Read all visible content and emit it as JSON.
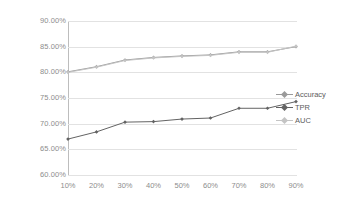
{
  "chart_data": {
    "type": "line",
    "title": "",
    "subtitle": "",
    "xlabel": "",
    "ylabel": "",
    "categories": [
      "10%",
      "20%",
      "30%",
      "40%",
      "50%",
      "60%",
      "70%",
      "80%",
      "90%"
    ],
    "x": [
      10,
      20,
      30,
      40,
      50,
      60,
      70,
      80,
      90
    ],
    "ylim": [
      60,
      90
    ],
    "xlim": [
      10,
      90
    ],
    "y_tick_labels": [
      "90.00%",
      "85.00%",
      "80.00%",
      "75.00%",
      "70.00%",
      "65.00%",
      "60.00%"
    ],
    "y_tick_values": [
      90,
      85,
      80,
      75,
      70,
      65,
      60
    ],
    "x_tick_labels": [
      "10%",
      "20%",
      "30%",
      "40%",
      "50%",
      "60%",
      "70%",
      "80%",
      "90%"
    ],
    "grid": "horizontal",
    "legend_position": "right",
    "value_suffix": "%",
    "series": [
      {
        "name": "Accuracy",
        "color": "#9a9a9a",
        "values": [
          80.1,
          81.1,
          82.4,
          82.9,
          83.2,
          83.4,
          84.0,
          84.0,
          85.0
        ]
      },
      {
        "name": "TPR",
        "color": "#636363",
        "values": [
          67.0,
          68.4,
          70.3,
          70.4,
          70.9,
          71.1,
          73.0,
          73.0,
          74.3
        ]
      },
      {
        "name": "AUC",
        "color": "#c4c4c4",
        "values": [
          80.0,
          81.0,
          82.3,
          82.8,
          83.1,
          83.3,
          83.9,
          83.9,
          85.1
        ]
      }
    ]
  },
  "legend": {
    "entries": [
      {
        "label": "Accuracy"
      },
      {
        "label": "TPR"
      },
      {
        "label": "AUC"
      }
    ]
  },
  "colors": {
    "grid": "#e2e2e2",
    "axis": "#bdbdbd",
    "tick_text": "#8d8d8d",
    "legend_text": "#5c5c5c",
    "background": "#ffffff"
  }
}
